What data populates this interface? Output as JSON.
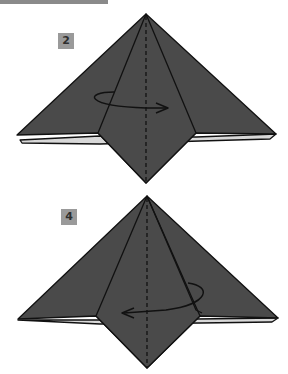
{
  "diagram": {
    "type": "origami-instruction",
    "steps": [
      {
        "number": "2",
        "arrow_direction": "right",
        "action": "turn over / rotate"
      },
      {
        "number": "4",
        "arrow_direction": "left",
        "action": "turn over / rotate"
      }
    ],
    "colors": {
      "paper": "#4a4a4a",
      "outline": "#111111",
      "badge": "#9a9a9a",
      "background": "#ffffff"
    }
  }
}
